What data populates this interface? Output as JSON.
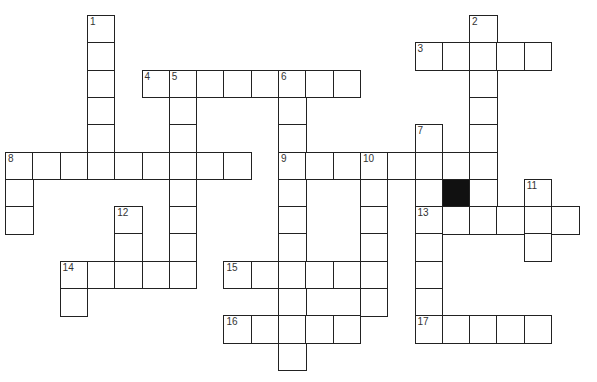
{
  "puzzle": {
    "type": "crossword",
    "grid": {
      "origin_x": 5,
      "origin_y": 15,
      "cell_size": 27.3,
      "cols": 21,
      "rows": 13
    },
    "black_cells": [
      [
        6,
        16
      ]
    ],
    "entries": [
      {
        "number": "1",
        "direction": "down",
        "row": 0,
        "col": 3,
        "length": 6
      },
      {
        "number": "2",
        "direction": "down",
        "row": 0,
        "col": 17,
        "length": 8
      },
      {
        "number": "3",
        "direction": "across",
        "row": 1,
        "col": 15,
        "length": 5
      },
      {
        "number": "4",
        "direction": "across",
        "row": 2,
        "col": 5,
        "length": 8
      },
      {
        "number": "5",
        "direction": "down",
        "row": 2,
        "col": 6,
        "length": 8
      },
      {
        "number": "6",
        "direction": "down",
        "row": 2,
        "col": 10,
        "length": 11
      },
      {
        "number": "7",
        "direction": "down",
        "row": 4,
        "col": 15,
        "length": 8
      },
      {
        "number": "8",
        "direction": "across",
        "row": 5,
        "col": 0,
        "length": 9
      },
      {
        "number": "8",
        "direction": "down",
        "row": 5,
        "col": 0,
        "length": 3
      },
      {
        "number": "9",
        "direction": "across",
        "row": 5,
        "col": 10,
        "length": 8
      },
      {
        "number": "10",
        "direction": "down",
        "row": 5,
        "col": 13,
        "length": 6
      },
      {
        "number": "11",
        "direction": "down",
        "row": 6,
        "col": 19,
        "length": 3
      },
      {
        "number": "12",
        "direction": "down",
        "row": 7,
        "col": 4,
        "length": 3
      },
      {
        "number": "13",
        "direction": "across",
        "row": 7,
        "col": 15,
        "length": 6
      },
      {
        "number": "14",
        "direction": "across",
        "row": 9,
        "col": 2,
        "length": 5
      },
      {
        "number": "14",
        "direction": "down",
        "row": 9,
        "col": 2,
        "length": 2
      },
      {
        "number": "15",
        "direction": "across",
        "row": 9,
        "col": 8,
        "length": 6
      },
      {
        "number": "16",
        "direction": "across",
        "row": 11,
        "col": 8,
        "length": 5
      },
      {
        "number": "17",
        "direction": "across",
        "row": 11,
        "col": 15,
        "length": 5
      }
    ]
  }
}
